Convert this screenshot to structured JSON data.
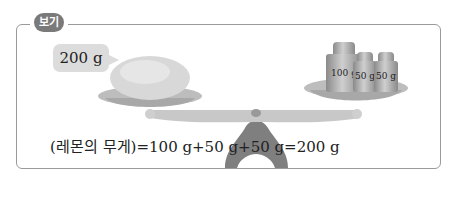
{
  "example": {
    "tag_label": "보기",
    "bubble_label": "200 g",
    "weights": [
      {
        "label": "100 g"
      },
      {
        "label": "50 g"
      },
      {
        "label": "50 g"
      }
    ],
    "formula": "(레몬의 무게)=100 g+50 g+50 g=200 g"
  }
}
